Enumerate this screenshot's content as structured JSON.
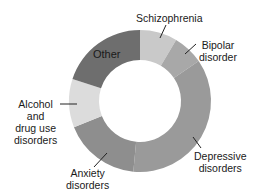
{
  "chart_data": {
    "type": "pie",
    "variant": "donut",
    "title": "",
    "categories": [
      "Schizophrenia",
      "Bipolar disorder",
      "Depressive disorders",
      "Anxiety disorders",
      "Alcohol and drug use disorders",
      "Other"
    ],
    "values": [
      8.5,
      7,
      36,
      17.5,
      11,
      20
    ],
    "colors": [
      "#c9c9c9",
      "#a8a8a8",
      "#9a9a9a",
      "#8e8e8e",
      "#dcdcdc",
      "#6e6e6e"
    ],
    "legend": "none (direct labels with leader lines)"
  },
  "labels": {
    "schizophrenia": "Schizophrenia",
    "bipolar_1": "Bipolar",
    "bipolar_2": "disorder",
    "depressive_1": "Depressive",
    "depressive_2": "disorders",
    "anxiety_1": "Anxiety",
    "anxiety_2": "disorders",
    "alcohol_1": "Alcohol",
    "alcohol_2": "and",
    "alcohol_3": "drug use",
    "alcohol_4": "disorders",
    "other": "Other"
  }
}
